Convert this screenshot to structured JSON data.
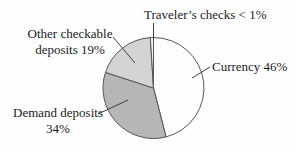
{
  "chart_data": {
    "type": "pie",
    "title": "",
    "direction": "clockwise",
    "start_angle_deg": 0,
    "categories": [
      "Currency",
      "Demand deposits",
      "Other checkable deposits",
      "Traveler's checks"
    ],
    "values": [
      46,
      34,
      19,
      1
    ],
    "slices": [
      {
        "id": "currency",
        "label": "Currency 46%",
        "value": 46,
        "color": "#fdfdfd"
      },
      {
        "id": "demand-deposits",
        "label": "Demand deposits 34%",
        "value": 34,
        "color": "#b6b6b6"
      },
      {
        "id": "other-checkable-deposits",
        "label": "Other checkable deposits 19%",
        "value": 19,
        "color": "#d4d4d4"
      },
      {
        "id": "travelers-checks",
        "label": "Traveler's checks < 1%",
        "value": 1,
        "color": "#f6f6f6"
      }
    ],
    "stroke_color": "#555555",
    "legend_position": "none",
    "grid": false
  },
  "labels": {
    "travelers": {
      "text": "Traveler’s checks < 1%"
    },
    "other": {
      "line1": "Other checkable",
      "line2": "deposits 19%"
    },
    "currency": {
      "text": "Currency 46%"
    },
    "demand": {
      "line1": "Demand deposits",
      "line2": "34%"
    }
  }
}
